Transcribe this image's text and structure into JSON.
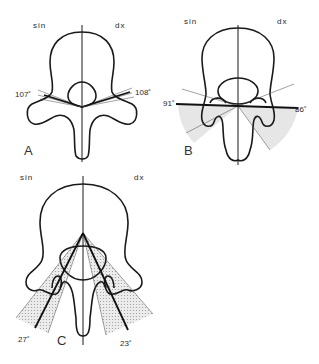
{
  "figure": {
    "panels": [
      {
        "id": "A",
        "label": "A",
        "side_left": "sin",
        "side_right": "dx",
        "angle_left": "107˚",
        "angle_right": "108˚"
      },
      {
        "id": "B",
        "label": "B",
        "side_left": "sin",
        "side_right": "dx",
        "angle_left": "91˚",
        "angle_right": "86˚"
      },
      {
        "id": "C",
        "label": "C",
        "side_left": "sin",
        "side_right": "dx",
        "angle_left": "27˚",
        "angle_right": "23˚"
      }
    ]
  },
  "colors": {
    "line": "#1a1a1a",
    "shade": "#d9d9d9",
    "background": "#ffffff"
  }
}
